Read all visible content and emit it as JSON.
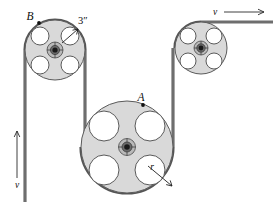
{
  "figure": {
    "type": "mechanical-diagram",
    "background_color": "#ffffff",
    "line_color": "#6e6e6e",
    "disk_fill": "#d9d9d9",
    "hole_fill": "#ffffff",
    "hub_color": "#1a1a1a"
  },
  "labels": {
    "pulley_a": "A",
    "pulley_b": "B",
    "radius_b_dimension": "3″",
    "radius_a_symbol": "r",
    "velocity_left": "v",
    "velocity_right": "v"
  },
  "pulleys": [
    {
      "id": "pulley-b",
      "label": "B",
      "center_x": 55,
      "center_y": 50,
      "radius": 30,
      "hole_count": 4,
      "hole_radius": 9,
      "dimension_label": "3″",
      "rim_point_label": "B"
    },
    {
      "id": "pulley-a",
      "label": "A",
      "center_x": 127,
      "center_y": 147,
      "radius": 46,
      "hole_count": 4,
      "hole_radius": 15,
      "dimension_label": "r",
      "rim_point_label": "A"
    },
    {
      "id": "pulley-right",
      "label": "",
      "center_x": 201,
      "center_y": 48,
      "radius": 26,
      "hole_count": 4,
      "hole_radius": 8,
      "dimension_label": "",
      "rim_point_label": ""
    }
  ],
  "velocity_indicators": [
    {
      "id": "velocity-left",
      "label": "v",
      "direction": "up",
      "label_x": 17,
      "label_y": 186
    },
    {
      "id": "velocity-right",
      "label": "v",
      "direction": "right",
      "label_x": 215,
      "label_y": 14
    }
  ]
}
